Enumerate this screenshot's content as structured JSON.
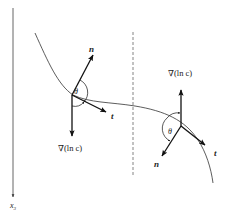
{
  "axis": {
    "label": "x",
    "subscript": "3",
    "direction": "down"
  },
  "left_point": {
    "normal_label": "n",
    "tangent_label": "t",
    "angle_label": "θ",
    "gradient_label": "∇(ln c)",
    "gradient_direction": "down"
  },
  "right_point": {
    "normal_label": "n",
    "tangent_label": "t",
    "angle_label": "θ",
    "gradient_label": "∇(ln c)",
    "gradient_direction": "up"
  },
  "divider": {
    "style": "dashed"
  },
  "colors": {
    "stroke": "#222222",
    "axis": "#555555",
    "background": "#ffffff"
  }
}
